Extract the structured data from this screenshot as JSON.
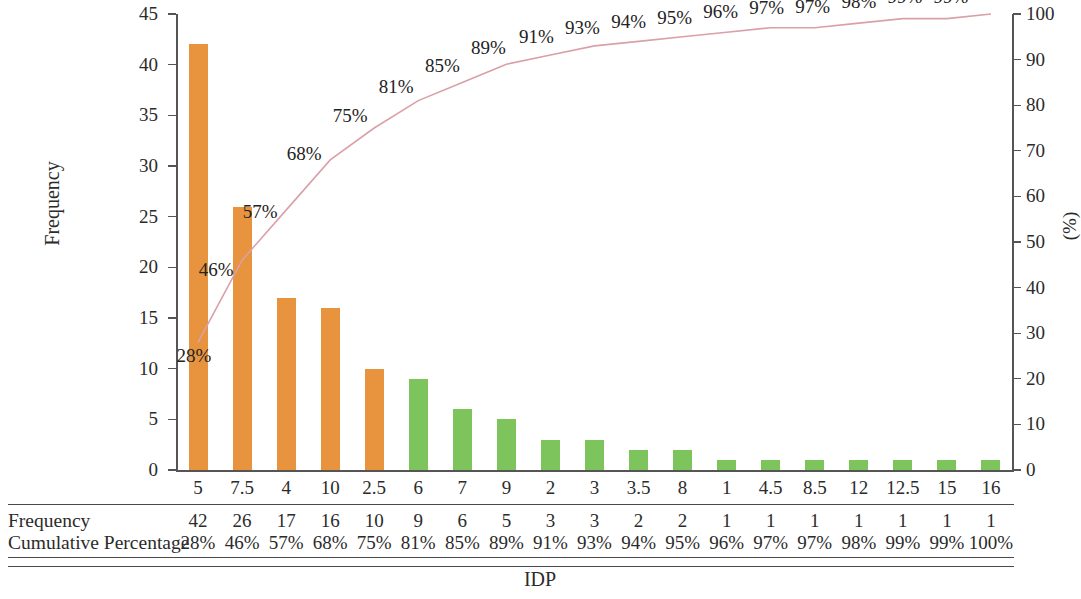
{
  "chart_data": {
    "type": "bar",
    "title": "",
    "subtitle": "",
    "xlabel": "IDP",
    "ylabel": "Frequency",
    "y2label": "(%)",
    "ylim": [
      0,
      45
    ],
    "y2lim": [
      0,
      100
    ],
    "grid": false,
    "legend": null,
    "categories": [
      "5",
      "7.5",
      "4",
      "10",
      "2.5",
      "6",
      "7",
      "9",
      "2",
      "3",
      "3.5",
      "8",
      "1",
      "4.5",
      "8.5",
      "12",
      "12.5",
      "15",
      "16"
    ],
    "series": [
      {
        "name": "Frequency",
        "type": "bar",
        "axis": "left",
        "values": [
          42,
          26,
          17,
          16,
          10,
          9,
          6,
          5,
          3,
          3,
          2,
          2,
          1,
          1,
          1,
          1,
          1,
          1,
          1
        ],
        "colors": [
          "#e8943e",
          "#e8943e",
          "#e8943e",
          "#e8943e",
          "#e8943e",
          "#7dc45c",
          "#7dc45c",
          "#7dc45c",
          "#7dc45c",
          "#7dc45c",
          "#7dc45c",
          "#7dc45c",
          "#7dc45c",
          "#7dc45c",
          "#7dc45c",
          "#7dc45c",
          "#7dc45c",
          "#7dc45c",
          "#7dc45c"
        ]
      },
      {
        "name": "Cumulative Percentage",
        "type": "line",
        "axis": "right",
        "color": "#d9a0a8",
        "values": [
          28,
          46,
          57,
          68,
          75,
          81,
          85,
          89,
          91,
          93,
          94,
          95,
          96,
          97,
          97,
          98,
          99,
          99,
          100
        ],
        "labels": [
          "28%",
          "46%",
          "57%",
          "68%",
          "75%",
          "81%",
          "85%",
          "89%",
          "91%",
          "93%",
          "94%",
          "95%",
          "96%",
          "97%",
          "97%",
          "98%",
          "99%",
          "99%",
          "100%"
        ]
      }
    ],
    "left_ticks": [
      "0",
      "5",
      "10",
      "15",
      "20",
      "25",
      "30",
      "35",
      "40",
      "45"
    ],
    "right_ticks": [
      "0",
      "10",
      "20",
      "30",
      "40",
      "50",
      "60",
      "70",
      "80",
      "90",
      "100"
    ]
  },
  "table": {
    "row_labels": [
      "Frequency",
      "Cumulative Percentage"
    ],
    "rows": [
      [
        "42",
        "26",
        "17",
        "16",
        "10",
        "9",
        "6",
        "5",
        "3",
        "3",
        "2",
        "2",
        "1",
        "1",
        "1",
        "1",
        "1",
        "1",
        "1"
      ],
      [
        "28%",
        "46%",
        "57%",
        "68%",
        "75%",
        "81%",
        "85%",
        "89%",
        "91%",
        "93%",
        "94%",
        "95%",
        "96%",
        "97%",
        "97%",
        "98%",
        "99%",
        "99%",
        "100%"
      ]
    ]
  },
  "axis_titles": {
    "left": "Frequency",
    "right": "(%)",
    "bottom": "IDP"
  },
  "colors": {
    "bar_primary": "#e8943e",
    "bar_secondary": "#7dc45c",
    "line": "#d9a0a8",
    "axis": "#555555",
    "text": "#2b2b2b"
  }
}
